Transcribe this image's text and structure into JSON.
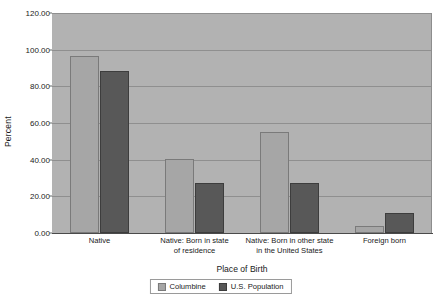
{
  "chart_data": {
    "type": "bar",
    "title": "",
    "subtitle": "",
    "xlabel": "Place of Birth",
    "ylabel": "Percent",
    "ylim": [
      0,
      120
    ],
    "ytick_labels": [
      "0.00",
      "20.00",
      "40.00",
      "60.00",
      "80.00",
      "100.00",
      "120.00"
    ],
    "ytick_values": [
      0,
      20,
      40,
      60,
      80,
      100,
      120
    ],
    "grid": true,
    "legend_position": "bottom",
    "categories": [
      "Native",
      "Native: Born in state of residence",
      "Native: Born in other state in the United States",
      "Foreign born"
    ],
    "category_lines": [
      [
        "Native"
      ],
      [
        "Native: Born in state",
        "of residence"
      ],
      [
        "Native: Born in other state",
        "in the United States"
      ],
      [
        "Foreign born"
      ]
    ],
    "series": [
      {
        "name": "Columbine",
        "color": "#a6a6a6",
        "values": [
          96.5,
          40.5,
          55.0,
          4.0
        ]
      },
      {
        "name": "U.S. Population",
        "color": "#585858",
        "values": [
          88.5,
          27.5,
          27.5,
          11.0
        ]
      }
    ]
  },
  "colors": {
    "plot_background": "#b2b2b2",
    "gridline": "#8f8f8f",
    "axis_line": "#4a4a4a",
    "text": "#1a1a1a",
    "page_background": "#ffffff"
  }
}
